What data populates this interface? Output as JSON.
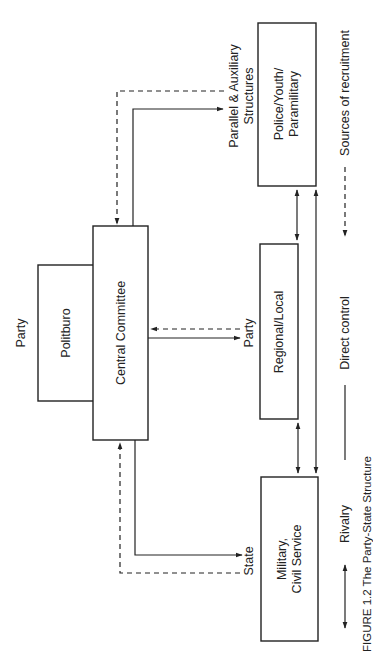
{
  "figure": {
    "caption": "FIGURE 1.2  The Party-State Structure",
    "orientation": "rotated 90° counter-clockwise"
  },
  "nodes": {
    "party_label": "Party",
    "politburo": "Politburo",
    "central_committee": "Central Committee",
    "police": {
      "line1": "Police/Youth/",
      "line2": "Paramilitary"
    },
    "regional": "Regional/Local",
    "military": {
      "line1": "Military,",
      "line2": "Civil Service"
    }
  },
  "connector_labels": {
    "parallel": {
      "line1": "Parallel & Auxiliary",
      "line2": "Structures"
    },
    "party": "Party",
    "state": "State"
  },
  "legend": {
    "sources": "Sources of recruitment",
    "direct": "Direct control",
    "rivalry": "Rivalry"
  },
  "colors": {
    "ink": "#222222",
    "background": "#ffffff"
  }
}
